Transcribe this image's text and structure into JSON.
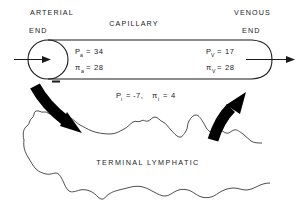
{
  "figure": {
    "title_arterial": "ARTERIAL",
    "title_arterial_end": "END",
    "title_capillary": "CAPILLARY",
    "title_venous": "VENOUS",
    "title_venous_end": "END",
    "title_lymphatic": "TERMINAL  LYMPHATIC",
    "line_color": "#1a1a1a",
    "arrow_color": "#000000",
    "background": "#ffffff"
  },
  "arterial": {
    "hydrostatic_symbol": "P",
    "hydrostatic_sub": "a",
    "hydrostatic_eq": "=",
    "hydrostatic_value": "34",
    "oncotic_symbol": "π",
    "oncotic_sub": "a",
    "oncotic_eq": "=",
    "oncotic_value": "28"
  },
  "venous": {
    "hydrostatic_symbol": "P",
    "hydrostatic_sub": "V",
    "hydrostatic_eq": "=",
    "hydrostatic_value": "17",
    "oncotic_symbol": "π",
    "oncotic_sub": "V",
    "oncotic_eq": "=",
    "oncotic_value": "28"
  },
  "interstitial": {
    "hydrostatic_symbol": "P",
    "hydrostatic_sub": "i",
    "hydrostatic_eq": "=",
    "hydrostatic_value": "-7,",
    "oncotic_symbol": "π",
    "oncotic_sub": "i",
    "oncotic_eq": "=",
    "oncotic_value": "4"
  }
}
